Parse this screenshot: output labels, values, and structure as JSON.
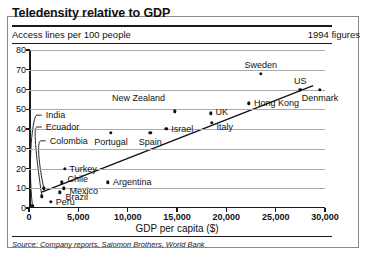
{
  "header": {
    "title": "Teledensity relative to GDP",
    "subtitle": "Access lines per 100 people",
    "figures": "1994 figures"
  },
  "footer": {
    "source": "Source: Company reports, Salomon Brothers, World Bank"
  },
  "chart_data": {
    "type": "scatter",
    "title": "Teledensity relative to GDP",
    "subtitle": "Access lines per 100 people",
    "annotation": "1994 figures",
    "xlabel": "GDP per capita ($)",
    "ylabel": "Access lines per 100 people",
    "xlim": [
      0,
      30000
    ],
    "ylim": [
      0,
      80
    ],
    "xticks": [
      "0",
      "5,000",
      "10,000",
      "15,000",
      "20,000",
      "25,000",
      "30,000"
    ],
    "xtick_values": [
      0,
      5000,
      10000,
      15000,
      20000,
      25000,
      30000
    ],
    "yticks": [
      "0",
      "10",
      "20",
      "30",
      "40",
      "50",
      "60",
      "70",
      "80"
    ],
    "ytick_values": [
      0,
      10,
      20,
      30,
      40,
      50,
      60,
      70,
      80
    ],
    "grid": true,
    "legend": false,
    "points": [
      {
        "name": "Sweden",
        "x": 23500,
        "y": 68,
        "label_dx": 0,
        "label_dy": -9,
        "align": "c"
      },
      {
        "name": "US",
        "x": 27500,
        "y": 60,
        "label_dx": 0,
        "label_dy": -9,
        "align": "c"
      },
      {
        "name": "Denmark",
        "x": 29500,
        "y": 60,
        "label_dx": 0,
        "label_dy": 8,
        "align": "c"
      },
      {
        "name": "Hong Kong",
        "x": 22300,
        "y": 53,
        "label_dx": 5,
        "label_dy": 0,
        "align": "r"
      },
      {
        "name": "UK",
        "x": 18400,
        "y": 48,
        "label_dx": 5,
        "label_dy": -1,
        "align": "r"
      },
      {
        "name": "Italy",
        "x": 18500,
        "y": 43,
        "label_dx": 5,
        "label_dy": 4,
        "align": "r"
      },
      {
        "name": "New Zealand",
        "x": 14800,
        "y": 49,
        "label_dx": -10,
        "label_dy": -13,
        "align": "l"
      },
      {
        "name": "Israel",
        "x": 13900,
        "y": 40,
        "label_dx": 5,
        "label_dy": 0,
        "align": "r"
      },
      {
        "name": "Spain",
        "x": 12300,
        "y": 38,
        "label_dx": 0,
        "label_dy": 9,
        "align": "c"
      },
      {
        "name": "Portugal",
        "x": 8300,
        "y": 38,
        "label_dx": 0,
        "label_dy": 9,
        "align": "c"
      },
      {
        "name": "Argentina",
        "x": 8000,
        "y": 13,
        "label_dx": 5,
        "label_dy": 0,
        "align": "r"
      },
      {
        "name": "Turkey",
        "x": 3600,
        "y": 20,
        "label_dx": 5,
        "label_dy": 0,
        "align": "r"
      },
      {
        "name": "Chile",
        "x": 3300,
        "y": 13,
        "label_dx": 6,
        "label_dy": -3,
        "align": "r"
      },
      {
        "name": "Mexico",
        "x": 3500,
        "y": 10,
        "label_dx": 6,
        "label_dy": 3,
        "align": "r"
      },
      {
        "name": "Brazil",
        "x": 3100,
        "y": 8,
        "label_dx": 6,
        "label_dy": 5,
        "align": "r"
      },
      {
        "name": "Peru",
        "x": 2200,
        "y": 3,
        "label_dx": 5,
        "label_dy": 0,
        "align": "r"
      },
      {
        "name": "India",
        "x": 350,
        "y": 1,
        "label_dx": 0,
        "label_dy": 0,
        "align": "r",
        "callout": true,
        "cx": 1700,
        "cy": 47
      },
      {
        "name": "Ecuador",
        "x": 1300,
        "y": 6,
        "label_dx": 0,
        "label_dy": 0,
        "align": "r",
        "callout": true,
        "cx": 1700,
        "cy": 41
      },
      {
        "name": "Colombia",
        "x": 1500,
        "y": 10,
        "label_dx": 0,
        "label_dy": 0,
        "align": "r",
        "callout": true,
        "cx": 2100,
        "cy": 34
      }
    ],
    "trendline": {
      "x1": 1300,
      "y1": 8,
      "x2": 28800,
      "y2": 62
    }
  }
}
